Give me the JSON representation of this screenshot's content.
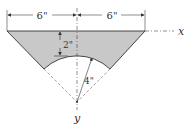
{
  "figure": {
    "dimension_left": "6\"",
    "dimension_right": "6\"",
    "depth_dimension": "2\"",
    "radius_dimension": "4\"",
    "axis_x_label": "x",
    "axis_y_label": "y",
    "fill_color": "#c8c8c8",
    "line_color": "#333333"
  }
}
